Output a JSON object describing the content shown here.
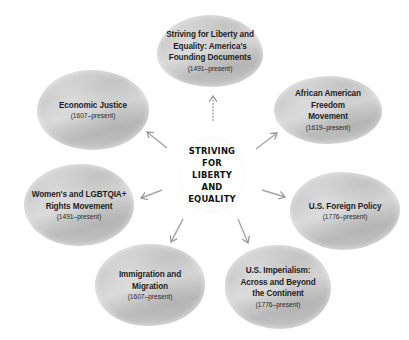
{
  "center": {
    "lines": [
      "STRIVING",
      "FOR",
      "LIBERTY",
      "AND",
      "EQUALITY"
    ]
  },
  "nodes": [
    {
      "id": "founding-documents",
      "title_lines": [
        "Striving for Liberty and",
        "Equality: America's",
        "Founding Documents"
      ],
      "dates": "(1491–present)"
    },
    {
      "id": "african-american-freedom",
      "title_lines": [
        "African American",
        "Freedom",
        "Movement"
      ],
      "dates": "(1619–present)"
    },
    {
      "id": "us-foreign-policy",
      "title_lines": [
        "U.S. Foreign Policy"
      ],
      "dates": "(1776–present)"
    },
    {
      "id": "us-imperialism",
      "title_lines": [
        "U.S. Imperialism:",
        "Across and Beyond",
        "the Continent"
      ],
      "dates": "(1776–present)"
    },
    {
      "id": "immigration-migration",
      "title_lines": [
        "Immigration and",
        "Migration"
      ],
      "dates": "(1607–present)"
    },
    {
      "id": "womens-lgbtqia-rights",
      "title_lines": [
        "Women's and LGBTQIA+",
        "Rights Movement"
      ],
      "dates": "(1491–present)"
    },
    {
      "id": "economic-justice",
      "title_lines": [
        "Economic Justice"
      ],
      "dates": "(1607–present)"
    }
  ],
  "colors": {
    "blob_fill": "#c9c9c9",
    "arrow": "#9a9a9a",
    "text": "#1e1e1e",
    "background": "#ffffff"
  }
}
